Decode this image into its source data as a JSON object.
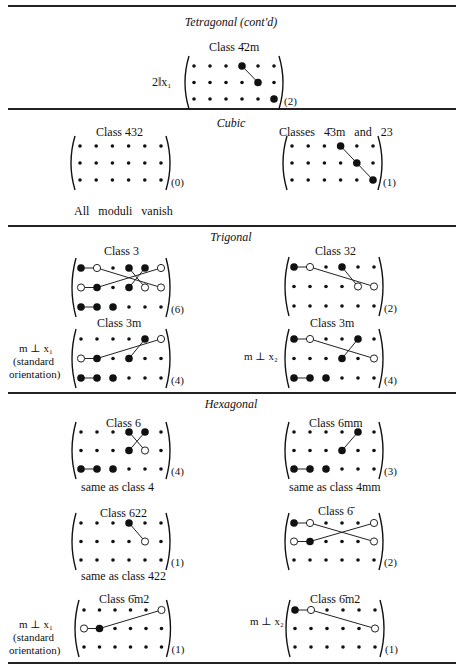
{
  "sections": {
    "tetragonal": {
      "title": "Tetragonal (cont'd)"
    },
    "cubic": {
      "title": "Cubic"
    },
    "trigonal": {
      "title": "Trigonal"
    },
    "hexagonal": {
      "title": "Hexagonal"
    }
  },
  "labels": {
    "t42m_class": "Class 4̄2m",
    "t42m_axis": "2‖x₁",
    "c432_class": "Class 432",
    "c432_note": "All moduli vanish",
    "c43m_class": "Classes 4̄3m and 23",
    "tr3_class": "Class 3",
    "tr32_class": "Class 32",
    "tr3m_class": "Class 3m",
    "tr3m_x1_note1": "m ⊥ x₁",
    "tr3m_x1_note2": "(standard",
    "tr3m_x1_note3": "orientation)",
    "tr3m_x2_class": "Class 3m",
    "tr3m_x2_note": "m ⊥ x₂",
    "h6_class": "Class 6",
    "h6_note": "same as class 4",
    "h6mm_class": "Class 6mm",
    "h6mm_note": "same as class 4mm",
    "h622_class": "Class 622",
    "h622_note": "same as class 422",
    "h6bar_class": "Class 6̄",
    "h6m2_class": "Class 6̄m2",
    "h6m2_x1_note1": "m ⊥ x₁",
    "h6m2_x1_note2": "(standard",
    "h6m2_x1_note3": "orientation)",
    "h6m2_x2_class": "Class 6̄m2",
    "h6m2_x2_note": "m ⊥ x₂"
  },
  "matrices": [
    {
      "id": "t42m",
      "x0": 194,
      "y0": 66,
      "dx": 16,
      "dy": 16.5,
      "count": "(2)",
      "big": [
        [
          0,
          3
        ],
        [
          1,
          4
        ],
        [
          2,
          5
        ]
      ],
      "open": [],
      "lines": [
        [
          [
            0,
            3
          ],
          [
            1,
            4
          ]
        ]
      ]
    },
    {
      "id": "c432",
      "x0": 80,
      "y0": 146,
      "dx": 16.2,
      "dy": 17,
      "count": "(0)",
      "big": [],
      "open": [],
      "lines": []
    },
    {
      "id": "c43m",
      "x0": 292,
      "y0": 146,
      "dx": 16.2,
      "dy": 17,
      "count": "(1)",
      "big": [
        [
          0,
          3
        ],
        [
          1,
          4
        ],
        [
          2,
          5
        ]
      ],
      "open": [],
      "lines": [
        [
          [
            0,
            3
          ],
          [
            1,
            4
          ]
        ],
        [
          [
            1,
            4
          ],
          [
            2,
            5
          ]
        ]
      ]
    },
    {
      "id": "tr3",
      "x0": 81,
      "y0": 268,
      "dx": 16,
      "dy": 19.5,
      "count": "(6)",
      "big": [
        [
          0,
          0
        ],
        [
          0,
          3
        ],
        [
          0,
          4
        ],
        [
          1,
          1
        ],
        [
          1,
          3
        ],
        [
          2,
          0
        ],
        [
          2,
          1
        ],
        [
          2,
          2
        ]
      ],
      "open": [
        [
          0,
          1
        ],
        [
          0,
          5
        ],
        [
          1,
          0
        ],
        [
          1,
          4
        ],
        [
          1,
          5
        ]
      ],
      "lines": [
        [
          [
            0,
            0
          ],
          [
            0,
            1
          ]
        ],
        [
          [
            0,
            1
          ],
          [
            1,
            5
          ]
        ],
        [
          [
            1,
            0
          ],
          [
            1,
            1
          ]
        ],
        [
          [
            1,
            1
          ],
          [
            0,
            5
          ]
        ],
        [
          [
            0,
            3
          ],
          [
            1,
            4
          ]
        ],
        [
          [
            0,
            4
          ],
          [
            1,
            3
          ]
        ],
        [
          [
            2,
            0
          ],
          [
            2,
            1
          ]
        ]
      ]
    },
    {
      "id": "tr32",
      "x0": 294,
      "y0": 267,
      "dx": 16,
      "dy": 19.5,
      "count": "(2)",
      "big": [
        [
          0,
          0
        ],
        [
          0,
          3
        ]
      ],
      "open": [
        [
          0,
          1
        ],
        [
          1,
          4
        ],
        [
          1,
          5
        ]
      ],
      "lines": [
        [
          [
            0,
            0
          ],
          [
            0,
            1
          ]
        ],
        [
          [
            0,
            1
          ],
          [
            1,
            5
          ]
        ],
        [
          [
            0,
            3
          ],
          [
            1,
            4
          ]
        ]
      ]
    },
    {
      "id": "tr3m",
      "x0": 81,
      "y0": 339,
      "dx": 16,
      "dy": 19.5,
      "count": "(4)",
      "big": [
        [
          0,
          4
        ],
        [
          1,
          1
        ],
        [
          1,
          3
        ],
        [
          2,
          0
        ],
        [
          2,
          1
        ],
        [
          2,
          2
        ]
      ],
      "open": [
        [
          0,
          5
        ],
        [
          1,
          0
        ]
      ],
      "lines": [
        [
          [
            1,
            0
          ],
          [
            1,
            1
          ]
        ],
        [
          [
            1,
            1
          ],
          [
            0,
            5
          ]
        ],
        [
          [
            0,
            4
          ],
          [
            1,
            3
          ]
        ],
        [
          [
            2,
            0
          ],
          [
            2,
            1
          ]
        ]
      ]
    },
    {
      "id": "tr3m_x2",
      "x0": 294,
      "y0": 339,
      "dx": 16,
      "dy": 19.5,
      "count": "(4)",
      "big": [
        [
          0,
          0
        ],
        [
          0,
          4
        ],
        [
          1,
          3
        ],
        [
          2,
          0
        ],
        [
          2,
          1
        ],
        [
          2,
          2
        ]
      ],
      "open": [
        [
          0,
          1
        ],
        [
          1,
          5
        ]
      ],
      "lines": [
        [
          [
            0,
            0
          ],
          [
            0,
            1
          ]
        ],
        [
          [
            0,
            1
          ],
          [
            1,
            5
          ]
        ],
        [
          [
            0,
            4
          ],
          [
            1,
            3
          ]
        ],
        [
          [
            2,
            0
          ],
          [
            2,
            1
          ]
        ]
      ]
    },
    {
      "id": "h6",
      "x0": 81,
      "y0": 432,
      "dx": 16,
      "dy": 18.5,
      "count": "(4)",
      "big": [
        [
          0,
          3
        ],
        [
          0,
          4
        ],
        [
          1,
          3
        ],
        [
          2,
          0
        ],
        [
          2,
          1
        ],
        [
          2,
          2
        ]
      ],
      "open": [
        [
          1,
          4
        ]
      ],
      "lines": [
        [
          [
            0,
            3
          ],
          [
            1,
            4
          ]
        ],
        [
          [
            0,
            4
          ],
          [
            1,
            3
          ]
        ],
        [
          [
            2,
            0
          ],
          [
            2,
            1
          ]
        ]
      ]
    },
    {
      "id": "h6mm",
      "x0": 294,
      "y0": 432,
      "dx": 16,
      "dy": 18.5,
      "count": "(3)",
      "big": [
        [
          0,
          4
        ],
        [
          1,
          3
        ],
        [
          2,
          0
        ],
        [
          2,
          1
        ],
        [
          2,
          2
        ]
      ],
      "open": [],
      "lines": [
        [
          [
            0,
            4
          ],
          [
            1,
            3
          ]
        ],
        [
          [
            2,
            0
          ],
          [
            2,
            1
          ]
        ]
      ]
    },
    {
      "id": "h622",
      "x0": 81,
      "y0": 523,
      "dx": 16,
      "dy": 18.5,
      "count": "(1)",
      "big": [
        [
          0,
          3
        ]
      ],
      "open": [
        [
          1,
          4
        ]
      ],
      "lines": [
        [
          [
            0,
            3
          ],
          [
            1,
            4
          ]
        ]
      ]
    },
    {
      "id": "h6bar",
      "x0": 294,
      "y0": 523,
      "dx": 16,
      "dy": 18.5,
      "count": "(2)",
      "big": [
        [
          0,
          0
        ],
        [
          1,
          1
        ]
      ],
      "open": [
        [
          0,
          1
        ],
        [
          0,
          5
        ],
        [
          1,
          0
        ],
        [
          1,
          5
        ]
      ],
      "lines": [
        [
          [
            0,
            0
          ],
          [
            0,
            1
          ]
        ],
        [
          [
            0,
            1
          ],
          [
            1,
            5
          ]
        ],
        [
          [
            1,
            0
          ],
          [
            1,
            1
          ]
        ],
        [
          [
            1,
            1
          ],
          [
            0,
            5
          ]
        ]
      ]
    },
    {
      "id": "h6m2",
      "x0": 84,
      "y0": 610,
      "dx": 15.5,
      "dy": 18.5,
      "count": "(1)",
      "big": [
        [
          1,
          1
        ]
      ],
      "open": [
        [
          0,
          5
        ],
        [
          1,
          0
        ]
      ],
      "lines": [
        [
          [
            1,
            0
          ],
          [
            1,
            1
          ]
        ],
        [
          [
            1,
            1
          ],
          [
            0,
            5
          ]
        ]
      ]
    },
    {
      "id": "h6m2_x2",
      "x0": 295,
      "y0": 610,
      "dx": 16,
      "dy": 18.5,
      "count": "(1)",
      "big": [
        [
          0,
          0
        ]
      ],
      "open": [
        [
          0,
          1
        ],
        [
          1,
          5
        ]
      ],
      "lines": [
        [
          [
            0,
            0
          ],
          [
            0,
            1
          ]
        ],
        [
          [
            0,
            1
          ],
          [
            1,
            5
          ]
        ]
      ]
    }
  ]
}
